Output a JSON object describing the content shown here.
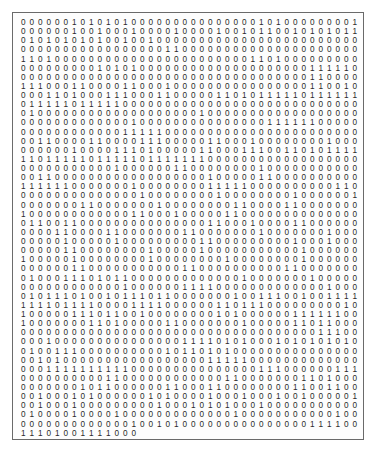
{
  "document": {
    "type": "binary-digit-grid",
    "columns": 40,
    "rows": [
      "0000001010101000000000000000101000000001010",
      "0000001001000100001000010010110010101011",
      "0101010101001001000000000000000000000000",
      "0000000000000000011000000000000000000000",
      "1101000000000000000000000001101000000000",
      "0000000001010100000000000000000000111110",
      "0000000000000000000000000000000000110000",
      "1110001100001100010000000000000000110010",
      "0001101000111000110000011010111110111111",
      "0111110111110000000000000000000000000000",
      "0100000000000000000001000000000000000000",
      "0000000000000100000000000000011111100000",
      "0000000000001111100000000000000000000000",
      "0011000011000011100000110001000000001000",
      "0000001000011101000001100011100110101111",
      "1101111101111101111111000000000000000000",
      "0000000000010000001100000000100000000000",
      "0011000000000000000000100000110000000000",
      "1111110000000100000000111110000000000110",
      "0000000000000010000000010000000010000001",
      "0000000110000000100000000110000110000000",
      "1000000000000110001000001100000000000000",
      "0110011000000000000000110001000011000000",
      "0000110000110000000110000000100000001000",
      "0000010000010000000001100000000010001000",
      "0000011000000001000001000000000001000000",
      "1000001000000001000000001000000001000000",
      "0000001100000000000110000000000110000000",
      "0100011101011000000000000010000000100000",
      "0000000000001000000111100000000000001000",
      "0101110100101110110000000100111001001111",
      "1111011110000111100000011011100000000010",
      "1000001110110010000000010100000011111100",
      "1000000011010000011000000010000011011000",
      "0000000000000000000000000000000000011100",
      "0001000000000000000111101010001010101010",
      "0100111000000000010110101000000000000000",
      "0010100000000000000000111110000000000000",
      "0001111111111000000000000000111000000111",
      "0000000000110000000000001100000001101000",
      "0000000101100000011000110000000011001100",
      "0010001010000001010000100010001001000001",
      "0010001000000000100010101000100000000000",
      "0100001000010000000000000100000000000100",
      "0000000000000100101000000000000000111100",
      "11101001111000"
    ]
  }
}
